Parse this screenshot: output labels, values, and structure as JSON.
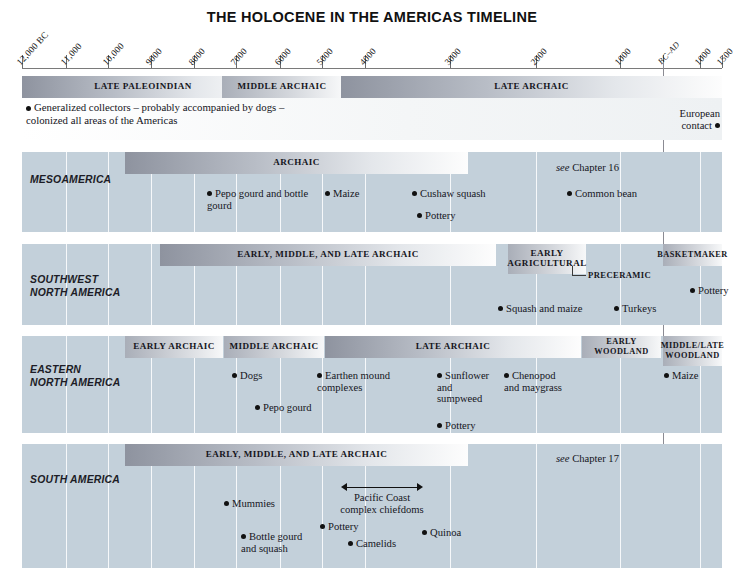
{
  "title": "THE HOLOCENE IN THE AMERICAS  TIMELINE",
  "axis": {
    "ticks": [
      {
        "label": "12,000 BC",
        "x": 22,
        "italic_suffix": true
      },
      {
        "label": "11,000",
        "x": 66
      },
      {
        "label": "10,000",
        "x": 108
      },
      {
        "label": "9000",
        "x": 151
      },
      {
        "label": "8000",
        "x": 194
      },
      {
        "label": "7000",
        "x": 236
      },
      {
        "label": "6000",
        "x": 280
      },
      {
        "label": "5000",
        "x": 322
      },
      {
        "label": "4000",
        "x": 365
      },
      {
        "label": "3000",
        "x": 450
      },
      {
        "label": "2000",
        "x": 536
      },
      {
        "label": "1000",
        "x": 620
      },
      {
        "label": "BC–AD",
        "x": 706,
        "italic": true
      },
      {
        "label": "1000",
        "x": 748
      },
      {
        "label": "1500",
        "x": 770
      }
    ]
  },
  "top_scale": {
    "bands": [
      {
        "label": "LATE PALEOINDIAN",
        "style": "grad-dark"
      },
      {
        "label": "EARLY ARCHAIC",
        "style": "grad-mid"
      },
      {
        "label": "MIDDLE ARCHAIC",
        "style": "grad-short"
      },
      {
        "label": "LATE ARCHAIC",
        "style": "grad-dark"
      }
    ],
    "note": "Generalized collectors – probably accompanied by dogs –\ncolonized all areas of the Americas",
    "european_contact": "European\ncontact"
  },
  "rows": [
    {
      "name": "MESOAMERICA",
      "bands": [
        {
          "label": "ARCHAIC",
          "style": "grad-dark"
        }
      ],
      "see_chapter_prefix": "see",
      "see_chapter": "Chapter 16",
      "events": [
        {
          "label": "Pepo gourd and bottle\ngourd"
        },
        {
          "label": "Maize"
        },
        {
          "label": "Cushaw squash"
        },
        {
          "label": "Pottery"
        },
        {
          "label": "Common bean"
        }
      ]
    },
    {
      "name": "SOUTHWEST\nNORTH AMERICA",
      "bands": [
        {
          "label": "EARLY, MIDDLE, AND LATE ARCHAIC",
          "style": "grad-dark"
        },
        {
          "label": "EARLY\nAGRICULTURAL",
          "style": "grad-short"
        },
        {
          "label": "BASKETMAKER",
          "style": "grad-short"
        }
      ],
      "leader_label": "PRECERAMIC",
      "events": [
        {
          "label": "Squash and maize"
        },
        {
          "label": "Turkeys"
        },
        {
          "label": "Pottery"
        }
      ]
    },
    {
      "name": "EASTERN\nNORTH AMERICA",
      "bands": [
        {
          "label": "EARLY ARCHAIC",
          "style": "grad-short"
        },
        {
          "label": "MIDDLE ARCHAIC",
          "style": "grad-short"
        },
        {
          "label": "LATE ARCHAIC",
          "style": "grad-dark"
        },
        {
          "label": "EARLY WOODLAND",
          "style": "grad-short"
        },
        {
          "label": "MIDDLE/LATE\nWOODLAND",
          "style": "grad-short"
        }
      ],
      "events": [
        {
          "label": "Dogs"
        },
        {
          "label": "Pepo gourd"
        },
        {
          "label": "Earthen mound\ncomplexes"
        },
        {
          "label": "Sunflower\nand\nsumpweed"
        },
        {
          "label": "Pottery"
        },
        {
          "label": "Chenopod\nand maygrass"
        },
        {
          "label": "Maize"
        }
      ]
    },
    {
      "name": "SOUTH AMERICA",
      "bands": [
        {
          "label": "EARLY, MIDDLE, AND LATE ARCHAIC",
          "style": "grad-dark"
        }
      ],
      "see_chapter_prefix": "see",
      "see_chapter": "Chapter 17",
      "annotation": "Pacific Coast\ncomplex chiefdoms",
      "events": [
        {
          "label": "Mummies"
        },
        {
          "label": "Bottle gourd\nand squash"
        },
        {
          "label": "Pottery"
        },
        {
          "label": "Camelids"
        },
        {
          "label": "Quinoa"
        }
      ]
    }
  ],
  "colors": {
    "row_background": "#c3d0da",
    "band_dark": "#8e939f",
    "band_light": "#fdfdfd",
    "page_background": "#ffffff",
    "text": "#15151c"
  }
}
